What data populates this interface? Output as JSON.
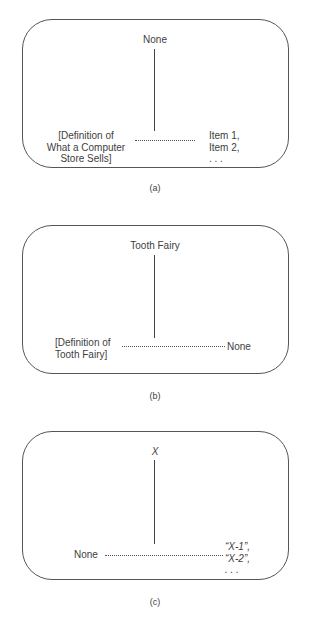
{
  "figures": [
    {
      "caption": "(a)",
      "top_label": "None",
      "left_label": "[Definition of\nWhat a Computer\nStore Sells]",
      "right_label": "Item 1,\nItem 2,\n. . ."
    },
    {
      "caption": "(b)",
      "top_label": "Tooth Fairy",
      "left_label": "[Definition of\nTooth Fairy]",
      "right_label": "None"
    },
    {
      "caption": "(c)",
      "top_label": "X",
      "left_label": "None",
      "right_label": "“X-1”,\n“X-2”,\n. . ."
    }
  ],
  "colors": {
    "stroke": "#555555",
    "text": "#3e3e3e",
    "background": "#ffffff"
  }
}
